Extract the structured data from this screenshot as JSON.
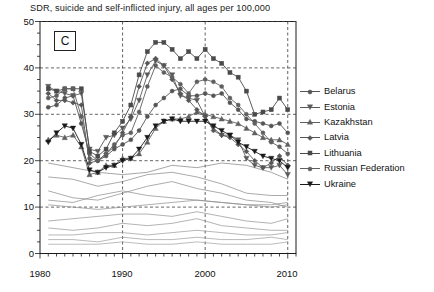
{
  "chart_data": {
    "type": "line",
    "title": "SDR, suicide and self-inflicted injury, all ages per 100,000",
    "panel_label": "C",
    "xlabel": "",
    "ylabel": "",
    "xlim": [
      1980,
      2011
    ],
    "ylim": [
      0,
      50
    ],
    "yticks": [
      0,
      10,
      20,
      30,
      40,
      50
    ],
    "xticks": [
      1980,
      1990,
      2000,
      2010
    ],
    "xtick_labels": [
      "1980",
      "1990",
      "2000",
      "2010"
    ],
    "ytick_labels": [
      "0",
      "10",
      "20",
      "30",
      "40",
      "50"
    ],
    "grid": "dashed gridlines at every y tick and x tick",
    "minor_ticks": "yearly tick marks on x axis",
    "legend_position": "right",
    "series": [
      {
        "name": "Belarus",
        "marker": "circle",
        "color": "#555555",
        "x": [
          1981,
          1982,
          1983,
          1984,
          1985,
          1986,
          1987,
          1988,
          1989,
          1990,
          1991,
          1992,
          1993,
          1994,
          1995,
          1996,
          1997,
          1998,
          1999,
          2000,
          2001,
          2002,
          2003,
          2004,
          2005,
          2006,
          2007,
          2008,
          2009,
          2010
        ],
        "y": [
          31.5,
          32.0,
          33.5,
          34.0,
          28.0,
          21.5,
          20.0,
          21.0,
          22.5,
          23.5,
          24.5,
          26.5,
          29.5,
          32.0,
          33.5,
          35.0,
          35.5,
          34.0,
          34.0,
          34.5,
          34.0,
          34.5,
          32.5,
          31.0,
          29.0,
          28.5,
          28.0,
          27.5,
          28.0,
          26.0
        ]
      },
      {
        "name": "Estonia",
        "marker": "triangle-down",
        "color": "#5a5a5a",
        "x": [
          1981,
          1982,
          1983,
          1984,
          1985,
          1986,
          1987,
          1988,
          1989,
          1990,
          1991,
          1992,
          1993,
          1994,
          1995,
          1996,
          1997,
          1998,
          1999,
          2000,
          2001,
          2002,
          2003,
          2004,
          2005,
          2006,
          2007,
          2008,
          2009,
          2010
        ],
        "y": [
          36.0,
          35.0,
          34.5,
          34.0,
          34.5,
          22.5,
          22.0,
          25.0,
          25.5,
          27.0,
          29.0,
          33.0,
          38.5,
          41.5,
          40.5,
          38.5,
          34.0,
          33.5,
          33.0,
          29.5,
          27.0,
          25.5,
          25.5,
          24.5,
          20.5,
          19.0,
          18.5,
          18.5,
          19.0,
          17.0
        ]
      },
      {
        "name": "Kazakhstan",
        "marker": "triangle-up",
        "color": "#606060",
        "x": [
          1981,
          1982,
          1983,
          1984,
          1985,
          1986,
          1987,
          1988,
          1989,
          1990,
          1991,
          1992,
          1993,
          1994,
          1995,
          1996,
          1997,
          1998,
          1999,
          2000,
          2001,
          2002,
          2003,
          2004,
          2005,
          2006,
          2007,
          2008,
          2009,
          2010
        ],
        "y": [
          24.5,
          25.5,
          25.0,
          25.5,
          23.0,
          17.0,
          17.5,
          19.0,
          19.0,
          20.5,
          20.5,
          21.5,
          24.0,
          27.0,
          28.5,
          29.0,
          29.0,
          29.5,
          30.5,
          30.0,
          29.5,
          29.0,
          28.5,
          28.0,
          27.0,
          26.0,
          25.0,
          24.5,
          24.5,
          23.5
        ]
      },
      {
        "name": "Latvia",
        "marker": "diamond",
        "color": "#565656",
        "x": [
          1981,
          1982,
          1983,
          1984,
          1985,
          1986,
          1987,
          1988,
          1989,
          1990,
          1991,
          1992,
          1993,
          1994,
          1995,
          1996,
          1997,
          1998,
          1999,
          2000,
          2001,
          2002,
          2003,
          2004,
          2005,
          2006,
          2007,
          2008,
          2009,
          2010
        ],
        "y": [
          34.5,
          33.0,
          33.0,
          32.5,
          32.0,
          19.5,
          20.0,
          21.5,
          23.0,
          26.0,
          29.5,
          36.0,
          41.0,
          42.0,
          40.5,
          37.5,
          34.5,
          33.0,
          31.0,
          29.5,
          26.5,
          25.5,
          25.0,
          23.5,
          22.0,
          20.0,
          18.5,
          19.5,
          21.0,
          19.0
        ]
      },
      {
        "name": "Lithuania",
        "marker": "square",
        "color": "#4a4a4a",
        "x": [
          1981,
          1982,
          1983,
          1984,
          1985,
          1986,
          1987,
          1988,
          1989,
          1990,
          1991,
          1992,
          1993,
          1994,
          1995,
          1996,
          1997,
          1998,
          1999,
          2000,
          2001,
          2002,
          2003,
          2004,
          2005,
          2006,
          2007,
          2008,
          2009,
          2010
        ],
        "y": [
          35.5,
          35.0,
          35.5,
          35.5,
          35.5,
          22.0,
          21.0,
          22.5,
          26.0,
          28.5,
          32.0,
          38.5,
          43.5,
          45.5,
          45.5,
          44.0,
          42.0,
          43.5,
          42.0,
          44.0,
          42.0,
          41.0,
          39.0,
          38.0,
          35.0,
          30.0,
          30.5,
          31.0,
          33.5,
          31.0
        ]
      },
      {
        "name": "Russian Federation",
        "marker": "circle",
        "color": "#5f5f5f",
        "x": [
          1981,
          1982,
          1983,
          1984,
          1985,
          1986,
          1987,
          1988,
          1989,
          1990,
          1991,
          1992,
          1993,
          1994,
          1995,
          1996,
          1997,
          1998,
          1999,
          2000,
          2001,
          2002,
          2003,
          2004,
          2005,
          2006,
          2007,
          2008,
          2009,
          2010
        ],
        "y": [
          33.5,
          34.0,
          35.5,
          35.5,
          29.5,
          20.5,
          20.0,
          21.5,
          23.5,
          25.5,
          26.0,
          30.5,
          36.0,
          40.5,
          39.0,
          38.0,
          36.5,
          34.5,
          37.0,
          37.5,
          37.0,
          36.0,
          33.5,
          32.0,
          30.0,
          28.0,
          26.0,
          24.0,
          23.0,
          21.5
        ]
      },
      {
        "name": "Ukraine",
        "marker": "triangle-down",
        "color": "#1a1a1a",
        "x": [
          1981,
          1982,
          1983,
          1984,
          1985,
          1986,
          1987,
          1988,
          1989,
          1990,
          1991,
          1992,
          1993,
          1994,
          1995,
          1996,
          1997,
          1998,
          1999,
          2000,
          2001,
          2002,
          2003,
          2004,
          2005,
          2006,
          2007,
          2008,
          2009,
          2010
        ],
        "y": [
          24.0,
          26.0,
          27.5,
          27.0,
          23.5,
          18.0,
          17.5,
          18.5,
          19.0,
          20.0,
          20.5,
          22.5,
          25.0,
          27.5,
          28.5,
          29.0,
          28.5,
          28.5,
          28.5,
          28.5,
          27.5,
          26.5,
          25.5,
          24.0,
          23.0,
          22.0,
          21.0,
          20.5,
          20.0,
          18.5
        ]
      }
    ],
    "background_series": [
      {
        "name": "other-country-1",
        "color": "#808080",
        "x": [
          1981,
          1984,
          1987,
          1990,
          1993,
          1996,
          1999,
          2002,
          2005,
          2008,
          2010
        ],
        "y": [
          19.5,
          18.5,
          17.5,
          17.0,
          17.5,
          19.0,
          18.5,
          19.5,
          19.0,
          17.5,
          16.0
        ]
      },
      {
        "name": "other-country-2",
        "color": "#858585",
        "x": [
          1981,
          1984,
          1987,
          1990,
          1993,
          1996,
          1999,
          2002,
          2005,
          2008,
          2010
        ],
        "y": [
          16.5,
          16.0,
          14.5,
          15.5,
          17.0,
          17.5,
          16.5,
          15.0,
          13.0,
          12.5,
          12.5
        ]
      },
      {
        "name": "other-country-3",
        "color": "#888888",
        "x": [
          1981,
          1984,
          1987,
          1990,
          1993,
          1996,
          1999,
          2002,
          2005,
          2008,
          2010
        ],
        "y": [
          13.5,
          12.0,
          11.5,
          13.0,
          14.5,
          15.5,
          14.0,
          13.0,
          11.5,
          11.0,
          10.0
        ]
      },
      {
        "name": "other-country-4",
        "color": "#8a8a8a",
        "x": [
          1981,
          1984,
          1987,
          1990,
          1993,
          1996,
          1999,
          2002,
          2005,
          2008,
          2010
        ],
        "y": [
          11.5,
          11.0,
          12.5,
          13.5,
          12.5,
          12.0,
          11.5,
          11.0,
          10.5,
          10.5,
          11.0
        ]
      },
      {
        "name": "other-country-5",
        "color": "#8d8d8d",
        "x": [
          1981,
          1984,
          1987,
          1990,
          1993,
          1996,
          1999,
          2002,
          2005,
          2008,
          2010
        ],
        "y": [
          10.5,
          10.0,
          9.5,
          10.0,
          10.5,
          11.0,
          11.5,
          11.0,
          10.5,
          10.0,
          10.5
        ]
      },
      {
        "name": "other-country-6",
        "color": "#909090",
        "x": [
          1981,
          1984,
          1987,
          1990,
          1993,
          1996,
          1999,
          2002,
          2005,
          2008,
          2010
        ],
        "y": [
          7.0,
          7.5,
          8.0,
          8.5,
          8.5,
          8.0,
          9.0,
          8.0,
          7.0,
          6.5,
          7.5
        ]
      },
      {
        "name": "other-country-7",
        "color": "#949494",
        "x": [
          1981,
          1984,
          1987,
          1990,
          1993,
          1996,
          1999,
          2002,
          2005,
          2008,
          2010
        ],
        "y": [
          5.5,
          5.0,
          5.5,
          6.5,
          6.0,
          6.5,
          7.5,
          6.0,
          5.5,
          5.0,
          5.0
        ]
      },
      {
        "name": "other-country-8",
        "color": "#989898",
        "x": [
          1981,
          1984,
          1987,
          1990,
          1993,
          1996,
          1999,
          2002,
          2005,
          2008,
          2010
        ],
        "y": [
          4.0,
          4.0,
          4.5,
          4.5,
          4.0,
          4.5,
          5.0,
          4.5,
          4.0,
          4.0,
          4.5
        ]
      },
      {
        "name": "other-country-9",
        "color": "#9c9c9c",
        "x": [
          1981,
          1984,
          1987,
          1990,
          1993,
          1996,
          1999,
          2002,
          2005,
          2008,
          2010
        ],
        "y": [
          3.0,
          3.0,
          2.5,
          3.5,
          3.0,
          3.0,
          3.5,
          3.0,
          3.0,
          3.5,
          3.0
        ]
      },
      {
        "name": "other-country-10",
        "color": "#9f9f9f",
        "x": [
          1981,
          1984,
          1987,
          1990,
          1993,
          1996,
          1999,
          2002,
          2005,
          2008,
          2010
        ],
        "y": [
          2.0,
          2.0,
          2.0,
          2.5,
          2.0,
          2.0,
          2.5,
          2.0,
          2.0,
          2.0,
          2.5
        ]
      }
    ]
  },
  "legend": {
    "items": [
      {
        "label": "Belarus"
      },
      {
        "label": "Estonia"
      },
      {
        "label": "Kazakhstan"
      },
      {
        "label": "Latvia"
      },
      {
        "label": "Lithuania"
      },
      {
        "label": "Russian Federation"
      },
      {
        "label": "Ukraine"
      }
    ]
  }
}
